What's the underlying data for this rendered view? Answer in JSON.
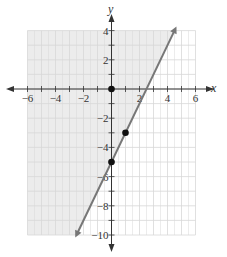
{
  "graph": {
    "x_axis_label": "x",
    "y_axis_label": "y",
    "x_ticks": [
      {
        "value": -6,
        "label": "−6"
      },
      {
        "value": -4,
        "label": "−4"
      },
      {
        "value": -2,
        "label": "−2"
      },
      {
        "value": 2,
        "label": "2"
      },
      {
        "value": 4,
        "label": "4"
      },
      {
        "value": 6,
        "label": "6"
      }
    ],
    "y_ticks": [
      {
        "value": 4,
        "label": "4"
      },
      {
        "value": 2,
        "label": "2"
      },
      {
        "value": -2,
        "label": "−2"
      },
      {
        "value": -4,
        "label": "−4"
      },
      {
        "value": -6,
        "label": "−6"
      },
      {
        "value": -8,
        "label": "−8"
      },
      {
        "value": -10,
        "label": "−10"
      }
    ],
    "line": {
      "equation": "y = 2x - 5",
      "slope": 2,
      "intercept": -5,
      "color": "#777777"
    },
    "points": [
      {
        "x": 0,
        "y": 0
      },
      {
        "x": 0,
        "y": -5
      },
      {
        "x": 1,
        "y": -3
      }
    ],
    "shaded_region": "upper-left of line (y >= 2x - 5)",
    "shade_color": "#ececec",
    "grid_color": "#d8d8d8",
    "x_range": [
      -6,
      6
    ],
    "y_range": [
      -10,
      4
    ]
  }
}
